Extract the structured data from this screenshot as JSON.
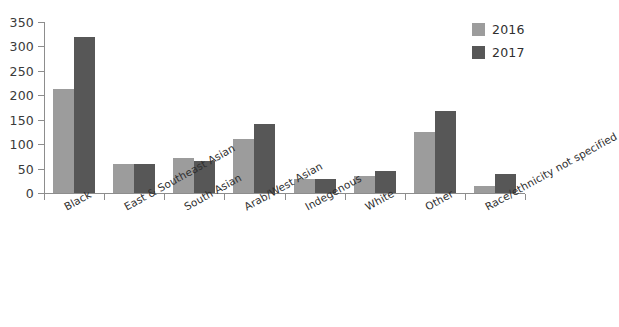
{
  "chart_data": {
    "type": "bar",
    "title": "",
    "subtitle": "",
    "xlabel": "",
    "ylabel": "",
    "ylim": [
      0,
      350
    ],
    "yticks": [
      0,
      50,
      100,
      150,
      200,
      250,
      300,
      350
    ],
    "grid": false,
    "legend_position": "top-right",
    "categories": [
      "Black",
      "East & Southeast Asian",
      "South Asian",
      "Arab/West Asian",
      "Indegenous",
      "White",
      "Other",
      "Race/ethnicity not specified"
    ],
    "series": [
      {
        "name": "2016",
        "color": "#9c9c9c",
        "values": [
          213,
          60,
          71,
          110,
          29,
          34,
          124,
          14
        ]
      },
      {
        "name": "2017",
        "color": "#575757",
        "values": [
          320,
          60,
          66,
          142,
          29,
          45,
          167,
          38
        ]
      }
    ]
  },
  "legend": {
    "items": [
      {
        "label": "2016",
        "color": "#9c9c9c"
      },
      {
        "label": "2017",
        "color": "#575757"
      }
    ]
  },
  "axis": {
    "y_tick_labels": [
      "0",
      "50",
      "100",
      "150",
      "200",
      "250",
      "300",
      "350"
    ]
  },
  "colors": {
    "series_2016": "#9c9c9c",
    "series_2017": "#575757",
    "axis": "#8d8d8d",
    "text": "#2f2f2f",
    "background": "#ffffff"
  }
}
